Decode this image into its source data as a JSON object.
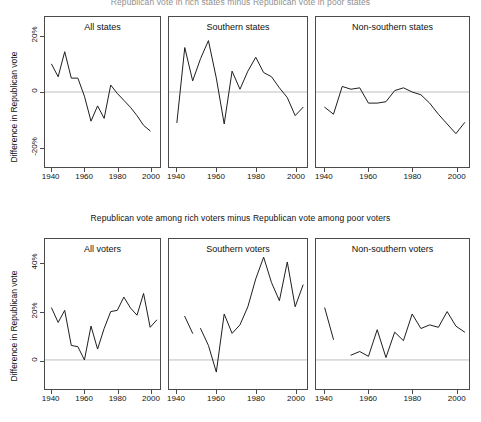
{
  "figure": {
    "width": 481,
    "height": 422,
    "background": "#ffffff",
    "line_color": "#1a1a1a",
    "zero_line_color": "#bdbdbd",
    "frame_color": "#4a4a4a"
  },
  "rows": [
    {
      "id": "states-row",
      "title": "Republican vote in rich states minus Republican vote in poor states",
      "ylabel": "Difference in Republican vote",
      "yticks": [
        "20%",
        "0",
        "-20%"
      ],
      "ytick_values": [
        20,
        0,
        -20
      ],
      "ylim": [
        -27,
        27
      ],
      "xticks": [
        "1940",
        "1960",
        "1980",
        "2000"
      ],
      "xtick_values": [
        1940,
        1960,
        1980,
        2000
      ],
      "xlim": [
        1936,
        2006
      ],
      "panels": [
        {
          "id": "all-states",
          "title": "All states"
        },
        {
          "id": "southern-states",
          "title": "Southern states"
        },
        {
          "id": "non-southern-states",
          "title": "Non-southern states"
        }
      ]
    },
    {
      "id": "voters-row",
      "title": "Republican vote among rich voters minus Republican vote among poor voters",
      "ylabel": "Difference in Republican vote",
      "yticks": [
        "40%",
        "20%",
        "0"
      ],
      "ytick_values": [
        40,
        20,
        0
      ],
      "ylim": [
        -12,
        50
      ],
      "xticks": [
        "1940",
        "1960",
        "1980",
        "2000"
      ],
      "xtick_values": [
        1940,
        1960,
        1980,
        2000
      ],
      "xlim": [
        1936,
        2006
      ],
      "panels": [
        {
          "id": "all-voters",
          "title": "All voters"
        },
        {
          "id": "southern-voters",
          "title": "Southern voters"
        },
        {
          "id": "non-southern-voters",
          "title": "Non-southern voters"
        }
      ]
    }
  ],
  "chart_data": [
    {
      "type": "line",
      "id": "all-states",
      "title": "All states",
      "panel_row": "Republican vote in rich states minus Republican vote in poor states",
      "xlabel": "",
      "ylabel": "Difference in Republican vote",
      "xlim": [
        1936,
        2006
      ],
      "ylim": [
        -27,
        27
      ],
      "xticks": [
        1940,
        1960,
        1980,
        2000
      ],
      "yticks": [
        20,
        0,
        -20
      ],
      "grid": false,
      "zero_line": true,
      "x": [
        1940,
        1944,
        1948,
        1952,
        1956,
        1960,
        1964,
        1968,
        1972,
        1976,
        1980,
        1984,
        1988,
        1992,
        1996,
        2000
      ],
      "y": [
        10.0,
        5.5,
        14.5,
        5.0,
        5.0,
        -1.5,
        -10.5,
        -5.0,
        -9.5,
        2.5,
        -0.5,
        -3.0,
        -5.5,
        -8.5,
        -12.0,
        -14.0
      ]
    },
    {
      "type": "line",
      "id": "southern-states",
      "title": "Southern states",
      "panel_row": "Republican vote in rich states minus Republican vote in poor states",
      "xlabel": "",
      "ylabel": "Difference in Republican vote",
      "xlim": [
        1936,
        2006
      ],
      "ylim": [
        -27,
        27
      ],
      "xticks": [
        1940,
        1960,
        1980,
        2000
      ],
      "yticks": [
        20,
        0,
        -20
      ],
      "grid": false,
      "zero_line": true,
      "x": [
        1940,
        1944,
        1948,
        1952,
        1956,
        1960,
        1964,
        1968,
        1972,
        1976,
        1980,
        1984,
        1988,
        1992,
        1996,
        2000,
        2004
      ],
      "y": [
        -11.0,
        16.0,
        4.0,
        12.0,
        18.5,
        5.0,
        -11.5,
        7.5,
        1.0,
        7.5,
        12.5,
        7.0,
        5.5,
        1.5,
        -2.0,
        -8.5,
        -5.5
      ]
    },
    {
      "type": "line",
      "id": "non-southern-states",
      "title": "Non-southern states",
      "panel_row": "Republican vote in rich states minus Republican vote in poor states",
      "xlabel": "",
      "ylabel": "Difference in Republican vote",
      "xlim": [
        1936,
        2006
      ],
      "ylim": [
        -27,
        27
      ],
      "xticks": [
        1940,
        1960,
        1980,
        2000
      ],
      "yticks": [
        20,
        0,
        -20
      ],
      "grid": false,
      "zero_line": true,
      "x": [
        1940,
        1944,
        1948,
        1952,
        1956,
        1960,
        1964,
        1968,
        1972,
        1976,
        1980,
        1984,
        1988,
        1992,
        1996,
        2000,
        2004
      ],
      "y": [
        -5.5,
        -8.0,
        2.0,
        1.0,
        1.5,
        -4.0,
        -4.0,
        -3.5,
        0.5,
        1.5,
        0.0,
        -1.0,
        -4.0,
        -8.0,
        -11.5,
        -15.0,
        -11.0
      ]
    },
    {
      "type": "line",
      "id": "all-voters",
      "title": "All voters",
      "panel_row": "Republican vote among rich voters minus Republican vote among poor voters",
      "xlabel": "",
      "ylabel": "Difference in Republican vote",
      "xlim": [
        1936,
        2006
      ],
      "ylim": [
        -12,
        50
      ],
      "xticks": [
        1940,
        1960,
        1980,
        2000
      ],
      "yticks": [
        40,
        20,
        0
      ],
      "grid": false,
      "zero_line": true,
      "x": [
        1940,
        1944,
        1948,
        1952,
        1956,
        1960,
        1964,
        1968,
        1972,
        1976,
        1980,
        1984,
        1988,
        1992,
        1996,
        2000,
        2004
      ],
      "y": [
        21.5,
        15.5,
        20.5,
        6.0,
        5.5,
        0.0,
        14.0,
        4.5,
        13.0,
        20.0,
        20.5,
        26.0,
        21.5,
        18.5,
        27.5,
        13.5,
        16.5
      ]
    },
    {
      "type": "line",
      "id": "southern-voters",
      "title": "Southern voters",
      "panel_row": "Republican vote among rich voters minus Republican vote among poor voters",
      "xlabel": "",
      "ylabel": "Difference in Republican vote",
      "xlim": [
        1936,
        2006
      ],
      "ylim": [
        -12,
        50
      ],
      "xticks": [
        1940,
        1960,
        1980,
        2000
      ],
      "yticks": [
        40,
        20,
        0
      ],
      "grid": false,
      "zero_line": true,
      "has_gap": true,
      "segments": [
        {
          "x": [
            1944,
            1948
          ],
          "y": [
            18.0,
            11.0
          ]
        },
        {
          "x": [
            1952,
            1956,
            1960,
            1964,
            1968,
            1972,
            1976,
            1980,
            1984,
            1988,
            1992,
            1996,
            2000,
            2004
          ],
          "y": [
            13.0,
            6.0,
            -5.0,
            19.0,
            11.0,
            14.5,
            22.0,
            33.5,
            42.5,
            32.0,
            24.5,
            40.5,
            22.0,
            31.0
          ]
        }
      ]
    },
    {
      "type": "line",
      "id": "non-southern-voters",
      "title": "Non-southern voters",
      "panel_row": "Republican vote among rich voters minus Republican vote among poor voters",
      "xlabel": "",
      "ylabel": "Difference in Republican vote",
      "xlim": [
        1936,
        2006
      ],
      "ylim": [
        -12,
        50
      ],
      "xticks": [
        1940,
        1960,
        1980,
        2000
      ],
      "yticks": [
        40,
        20,
        0
      ],
      "grid": false,
      "zero_line": true,
      "has_gap": true,
      "segments": [
        {
          "x": [
            1940,
            1944
          ],
          "y": [
            21.5,
            8.5
          ]
        },
        {
          "x": [
            1952,
            1956,
            1960,
            1964,
            1968,
            1972,
            1976,
            1980,
            1984,
            1988,
            1992,
            1996,
            2000,
            2004
          ],
          "y": [
            2.0,
            3.5,
            1.5,
            12.5,
            1.0,
            11.5,
            8.0,
            19.0,
            13.0,
            14.5,
            13.5,
            20.0,
            14.0,
            11.5
          ]
        }
      ]
    }
  ]
}
